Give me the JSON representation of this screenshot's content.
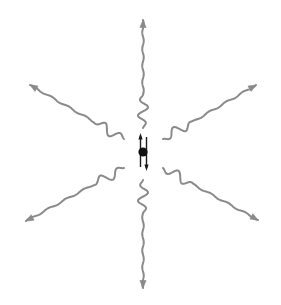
{
  "figure": {
    "canvas": {
      "width": 281,
      "height": 305,
      "background": "#ffffff"
    },
    "title": ""
  },
  "style": {
    "wave_color": "#8a8a8a",
    "wave_stroke_width": 2.0,
    "dipole_color": "#1a1a1a",
    "dipole_stroke_width": 1.4,
    "source_color": "#111111"
  },
  "source": {
    "label": "oscillating-dipole-source",
    "center_x": 143,
    "center_y": 152,
    "dot_radius": 4.6,
    "dot_color": "#111111"
  },
  "dipole_arrows": [
    {
      "name": "dipole-arrow-up",
      "direction": "up",
      "x": 140.5,
      "y_tail": 167,
      "y_head": 133,
      "head_width": 4.2,
      "head_length": 6.5
    },
    {
      "name": "dipole-arrow-down",
      "direction": "down",
      "x": 146.5,
      "y_tail": 137,
      "y_head": 171,
      "head_width": 4.2,
      "head_length": 6.5
    }
  ],
  "waves": [
    {
      "name": "wave-up",
      "direction": "up",
      "angle_deg": -90,
      "start": {
        "x": 143,
        "y": 128
      },
      "end": {
        "x": 143,
        "y": 20
      },
      "amplitude": 5.0,
      "cycles": 6.5,
      "arrowhead": true
    },
    {
      "name": "wave-down",
      "direction": "down",
      "angle_deg": 90,
      "start": {
        "x": 143,
        "y": 180
      },
      "end": {
        "x": 143,
        "y": 288
      },
      "amplitude": 5.0,
      "cycles": 6.5,
      "arrowhead": true
    },
    {
      "name": "wave-upper-left",
      "direction": "upper-left",
      "angle_deg": -150,
      "start": {
        "x": 124,
        "y": 139
      },
      "end": {
        "x": 30,
        "y": 85
      },
      "amplitude": 5.0,
      "cycles": 5.5,
      "arrowhead": true
    },
    {
      "name": "wave-upper-right",
      "direction": "upper-right",
      "angle_deg": -30,
      "start": {
        "x": 163,
        "y": 139
      },
      "end": {
        "x": 256,
        "y": 85
      },
      "amplitude": 5.0,
      "cycles": 5.5,
      "arrowhead": true
    },
    {
      "name": "wave-lower-left",
      "direction": "lower-left",
      "angle_deg": 150,
      "start": {
        "x": 124,
        "y": 168
      },
      "end": {
        "x": 26,
        "y": 221
      },
      "amplitude": 5.0,
      "cycles": 5.5,
      "arrowhead": true
    },
    {
      "name": "wave-lower-right",
      "direction": "lower-right",
      "angle_deg": 30,
      "start": {
        "x": 163,
        "y": 168
      },
      "end": {
        "x": 258,
        "y": 220
      },
      "amplitude": 5.0,
      "cycles": 5.5,
      "arrowhead": true
    }
  ]
}
